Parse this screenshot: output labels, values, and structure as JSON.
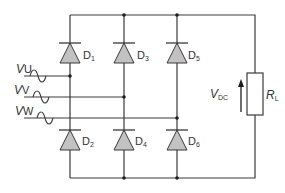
{
  "diagram": {
    "colors": {
      "wire": "#3a3a3a",
      "diode_fill": "#c2c2c2",
      "background": "#ffffff"
    },
    "inputs": [
      {
        "label_main": "V",
        "label_sub": "U",
        "icon": "ac-sine-wave-icon"
      },
      {
        "label_main": "V",
        "label_sub": "V",
        "icon": "ac-sine-wave-icon"
      },
      {
        "label_main": "V",
        "label_sub": "W",
        "icon": "ac-sine-wave-icon"
      }
    ],
    "diodes": [
      {
        "label_main": "D",
        "label_sub": "1",
        "position": "upper-left"
      },
      {
        "label_main": "D",
        "label_sub": "3",
        "position": "upper-middle"
      },
      {
        "label_main": "D",
        "label_sub": "5",
        "position": "upper-right"
      },
      {
        "label_main": "D",
        "label_sub": "2",
        "position": "lower-left"
      },
      {
        "label_main": "D",
        "label_sub": "4",
        "position": "lower-middle"
      },
      {
        "label_main": "D",
        "label_sub": "6",
        "position": "lower-right"
      }
    ],
    "output_voltage": {
      "label_main": "V",
      "label_sub": "DC"
    },
    "load": {
      "label_main": "R",
      "label_sub": "L"
    }
  }
}
